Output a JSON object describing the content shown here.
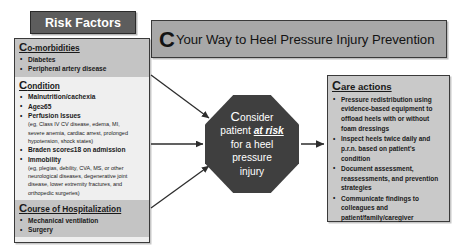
{
  "risk_factors_title": "Risk Factors",
  "header": {
    "lead_letter": "C",
    "rest": "Your Way to Heel Pressure Injury Prevention"
  },
  "risk_panel": {
    "sections": [
      {
        "cap": "C",
        "heading_rest": "o-morbidities",
        "shade": true,
        "items": [
          {
            "text": "Diabetes"
          },
          {
            "text": "Peripheral artery disease"
          }
        ]
      },
      {
        "cap": "C",
        "heading_rest": "ondition",
        "shade": false,
        "items": [
          {
            "text": "Malnutrition/cachexia"
          },
          {
            "text": "Age≥65"
          },
          {
            "text": "Perfusion Issues",
            "sub": [
              "(eg, Class IV CV disease, edema, MI,",
              "severe anemia, cardiac arrest, prolonged",
              "hypotension, shock states)"
            ]
          },
          {
            "text": "Braden score≤18 on admission"
          },
          {
            "text": "Immobility",
            "sub": [
              "(eg, plegias, debility, CVA, MS, or other",
              "neurological diseases, degenerative joint",
              "disease, lower extremity fractures, and",
              "orthopedic surgeries)"
            ]
          }
        ]
      },
      {
        "cap": "C",
        "heading_rest": "ourse of Hospitalization",
        "shade": true,
        "items": [
          {
            "text": "Mechanical ventilation"
          },
          {
            "text": "Surgery"
          }
        ]
      }
    ]
  },
  "octagon": {
    "lead_letter": "C",
    "line1_rest": "onsider",
    "line2_prefix": "patient ",
    "line2_emphasis": "at risk",
    "line3": "for a heel",
    "line4": "pressure",
    "line5": "injury"
  },
  "care_panel": {
    "cap": "C",
    "heading_rest": "are actions",
    "items": [
      "Pressure redistribution using evidence-based equipment to offload heels with or without foam dressings",
      "Inspect heels twice daily and p.r.n. based on patient's condition",
      "Document assessment, reassessments, and prevention strategies",
      "Communicate findings to colleagues and patient/family/caregiver"
    ]
  },
  "colors": {
    "title_plate_bg": "#5d5d5d",
    "banner_bg": "#a8a8a8",
    "panel_shade_bg": "#c4c4c4",
    "panel_light_bg": "#efefef",
    "octagon_bg": "#3f3f3f",
    "care_bg": "#c9c9c9",
    "border": "#3a3a3a",
    "text": "#1a1a1a",
    "octagon_text": "#ffffff"
  }
}
